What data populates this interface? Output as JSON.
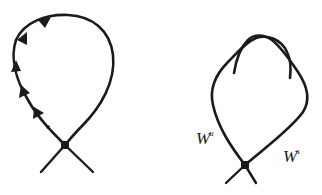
{
  "figure": {
    "colors": {
      "stroke": "#1a1a1a",
      "background": "#ffffff"
    },
    "left_panel": {
      "name": "homoclinic-loop",
      "saddle_point": {
        "x": 65,
        "y": 145
      },
      "arrow_count": 5,
      "arrow_direction": "upward-along-left-branch"
    },
    "right_panel": {
      "name": "manifold-tangle",
      "saddle_point": {
        "x": 245,
        "y": 165
      },
      "labels": {
        "unstable": {
          "base": "W",
          "superscript": "u"
        },
        "stable": {
          "base": "W",
          "superscript": "s"
        }
      }
    }
  }
}
